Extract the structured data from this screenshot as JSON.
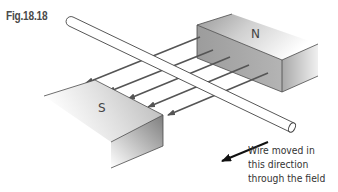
{
  "figure": {
    "label": "Fig.18.18",
    "caption_lines": [
      "Wire moved in",
      "this direction",
      "through the field"
    ]
  },
  "magnets": {
    "north": {
      "label": "N"
    },
    "south": {
      "label": "S"
    }
  },
  "field_lines": {
    "count": 5,
    "direction": "N to S",
    "color": "#555555"
  },
  "motion_arrow": {
    "color": "#111111"
  },
  "colors": {
    "magnet_light": "#f2f2f2",
    "magnet_mid": "#b8b8b8",
    "magnet_dark": "#8a8a8a",
    "outline": "#4a4a4a"
  }
}
